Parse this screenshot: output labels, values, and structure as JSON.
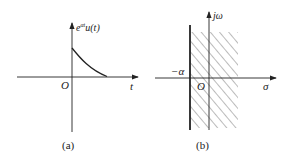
{
  "figure_a": {
    "y_label": "e",
    "y_label_sup": "αt",
    "y_label_rest": "u(t)",
    "origin_label": "O",
    "x_label": "t",
    "caption": "(a)"
  },
  "figure_b": {
    "y_label": "jω",
    "origin_label": "O",
    "x_label": "σ",
    "boundary_label": "−α",
    "caption": "(b)"
  },
  "colors": {
    "ink": "#222222",
    "hatch": "#555555"
  }
}
